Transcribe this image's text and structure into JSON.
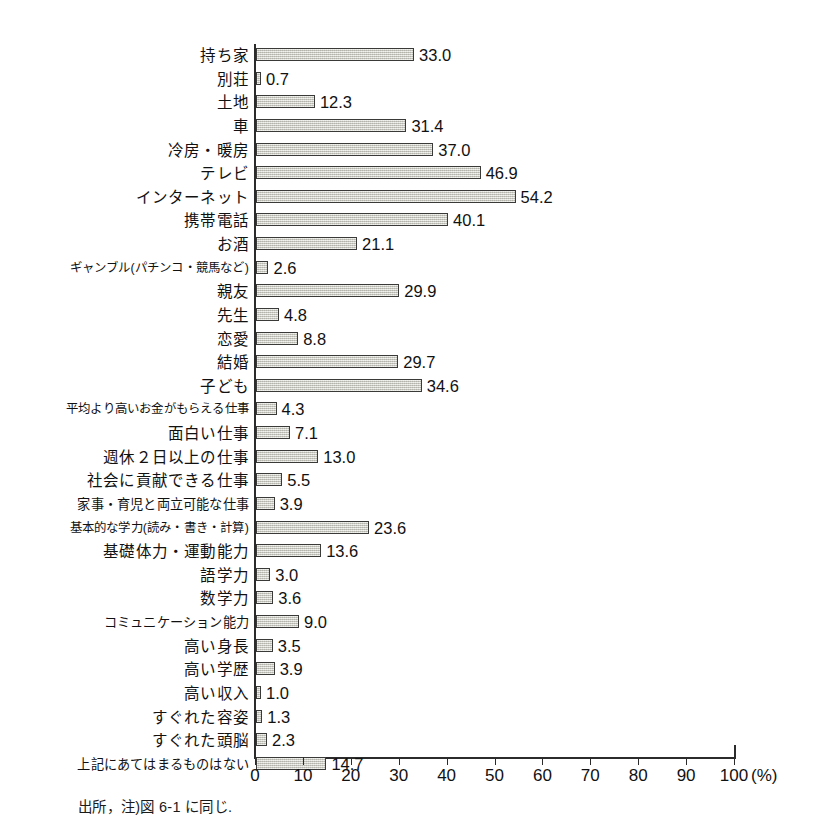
{
  "chart_data": {
    "type": "bar",
    "orientation": "horizontal",
    "title": "",
    "subtitle": "",
    "xlabel": "(%)",
    "ylabel": "",
    "xlim": [
      0,
      100
    ],
    "xticks": [
      "0",
      "10",
      "20",
      "30",
      "40",
      "50",
      "60",
      "70",
      "80",
      "90",
      "100"
    ],
    "xtick_values": [
      0,
      10,
      20,
      30,
      40,
      50,
      60,
      70,
      80,
      90,
      100
    ],
    "unit": "(%)",
    "grid": false,
    "legend": null,
    "categories": [
      "持ち家",
      "別荘",
      "土地",
      "車",
      "冷房・暖房",
      "テレビ",
      "インターネット",
      "携帯電話",
      "お酒",
      "ギャンブル(パチンコ・競馬など)",
      "親友",
      "先生",
      "恋愛",
      "結婚",
      "子ども",
      "平均より高いお金がもらえる仕事",
      "面白い仕事",
      "週休２日以上の仕事",
      "社会に貢献できる仕事",
      "家事・育児と両立可能な仕事",
      "基本的な学力(読み・書き・計算)",
      "基礎体力・運動能力",
      "語学力",
      "数学力",
      "コミュニケーション能力",
      "高い身長",
      "高い学歴",
      "高い収入",
      "すぐれた容姿",
      "すぐれた頭脳",
      "上記にあてはまるものはない"
    ],
    "values": [
      33.0,
      0.7,
      12.3,
      31.4,
      37.0,
      46.9,
      54.2,
      40.1,
      21.1,
      2.6,
      29.9,
      4.8,
      8.8,
      29.7,
      34.6,
      4.3,
      7.1,
      13.0,
      5.5,
      3.9,
      23.6,
      13.6,
      3.0,
      3.6,
      9.0,
      3.5,
      3.9,
      1.0,
      1.3,
      2.3,
      14.7
    ],
    "value_labels": [
      "33.0",
      "0.7",
      "12.3",
      "31.4",
      "37.0",
      "46.9",
      "54.2",
      "40.1",
      "21.1",
      "2.6",
      "29.9",
      "4.8",
      "8.8",
      "29.7",
      "34.6",
      "4.3",
      "7.1",
      "13.0",
      "5.5",
      "3.9",
      "23.6",
      "13.6",
      "3.0",
      "3.6",
      "9.0",
      "3.5",
      "3.9",
      "1.0",
      "1.3",
      "2.3",
      "14.7"
    ],
    "bar_fill_color": "#d4d4cd",
    "bar_border_color": "#3a3a38",
    "axis_color": "#2b2b2b"
  },
  "footnote": {
    "text": "出所，注)図 6-1 に同じ."
  }
}
